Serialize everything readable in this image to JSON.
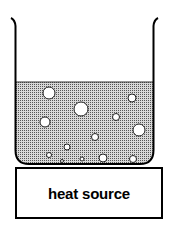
{
  "diagram": {
    "title": "",
    "heat_source": {
      "label": "heat source"
    },
    "beaker": {
      "contents": "liquid with bubbles",
      "liquid_color": "#b8b8b8",
      "outline_color": "#000000"
    },
    "bubbles": [
      {
        "cx": 49,
        "cy": 93,
        "r": 6
      },
      {
        "cx": 81,
        "cy": 109,
        "r": 7
      },
      {
        "cx": 132,
        "cy": 98,
        "r": 4
      },
      {
        "cx": 45,
        "cy": 122,
        "r": 5
      },
      {
        "cx": 116,
        "cy": 117,
        "r": 3.5
      },
      {
        "cx": 139,
        "cy": 130,
        "r": 6
      },
      {
        "cx": 95,
        "cy": 137,
        "r": 3.5
      },
      {
        "cx": 67,
        "cy": 147,
        "r": 3
      },
      {
        "cx": 49,
        "cy": 155,
        "r": 2.5
      },
      {
        "cx": 62,
        "cy": 161,
        "r": 1.5
      },
      {
        "cx": 82,
        "cy": 159,
        "r": 2
      },
      {
        "cx": 103,
        "cy": 158,
        "r": 4
      },
      {
        "cx": 133,
        "cy": 159,
        "r": 3.5
      }
    ]
  }
}
